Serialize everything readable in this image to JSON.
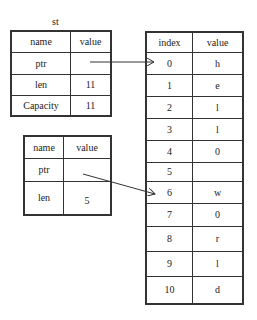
{
  "struct1": {
    "caption": "st",
    "headers": [
      "name",
      "value"
    ],
    "rows": [
      {
        "name": "ptr",
        "value": ""
      },
      {
        "name": "len",
        "value": "11"
      },
      {
        "name": "Capacity",
        "value": "11"
      }
    ]
  },
  "struct2": {
    "headers": [
      "name",
      "value"
    ],
    "rows": [
      {
        "name": "ptr",
        "value": ""
      },
      {
        "name": "len",
        "value": "5"
      }
    ]
  },
  "heap": {
    "headers": [
      "index",
      "value"
    ],
    "rows": [
      {
        "index": "0",
        "value": "h"
      },
      {
        "index": "1",
        "value": "e"
      },
      {
        "index": "2",
        "value": "l"
      },
      {
        "index": "3",
        "value": "l"
      },
      {
        "index": "4",
        "value": "0"
      },
      {
        "index": "5",
        "value": ""
      },
      {
        "index": "6",
        "value": "w"
      },
      {
        "index": "7",
        "value": "0"
      },
      {
        "index": "8",
        "value": "r"
      },
      {
        "index": "9",
        "value": "l"
      },
      {
        "index": "10",
        "value": "d"
      }
    ]
  },
  "arrows": [
    {
      "from": "struct1.ptr",
      "to": "heap.0"
    },
    {
      "from": "struct2.ptr",
      "to": "heap.6"
    }
  ]
}
